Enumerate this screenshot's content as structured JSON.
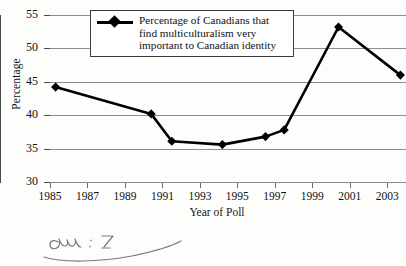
{
  "chart_data": {
    "type": "line",
    "title": "",
    "xlabel": "Year of Poll",
    "ylabel": "Percentage",
    "xlim": [
      1985,
      2004
    ],
    "ylim": [
      30,
      55
    ],
    "grid": true,
    "legend_position": "top-center",
    "x_ticks": [
      "1985",
      "1987",
      "1989",
      "1991",
      "1993",
      "1995",
      "1997",
      "1999",
      "2001",
      "2003"
    ],
    "y_ticks": [
      "30",
      "35",
      "40",
      "45",
      "50",
      "55"
    ],
    "series": [
      {
        "name": "Percentage of Canadians that find multiculturalism very important to Canadian identity",
        "marker": "diamond",
        "color": "#000000",
        "x": [
          1985.3,
          1990.4,
          1991.5,
          1994.2,
          1996.5,
          1997.5,
          2000.4,
          2003.7
        ],
        "values": [
          44.2,
          40.2,
          36.1,
          35.6,
          36.8,
          37.8,
          53.2,
          46.0
        ]
      }
    ]
  },
  "legend": {
    "entry_label": "Percentage of Canadians that find multiculturalism very important to Canadian identity"
  },
  "axes": {
    "y_title": "Percentage",
    "x_title": "Year of Poll"
  },
  "annotation": {
    "handwriting_note": "handwritten pencil scribble"
  }
}
